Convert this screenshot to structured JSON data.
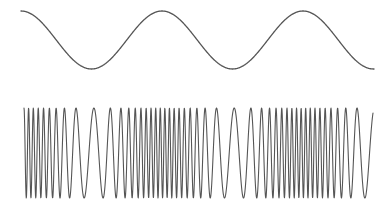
{
  "diagram": {
    "type": "frequency-modulation",
    "background": "#ffffff",
    "stroke_color": "#555555",
    "modulating_signal": {
      "label": "",
      "x_start": 21,
      "x_end": 374,
      "y_center": 40,
      "amplitude": 29,
      "period_px": 141,
      "phase_at_start": "peak",
      "stroke_width": 1.3
    },
    "modulated_carrier": {
      "label": "",
      "x_start": 24,
      "x_end": 373,
      "y_center": 153,
      "amplitude": 45,
      "base_frequency_cycles_per_px": 0.135,
      "frequency_deviation_cycles_per_px": 0.085,
      "stroke_width": 1.1
    }
  }
}
